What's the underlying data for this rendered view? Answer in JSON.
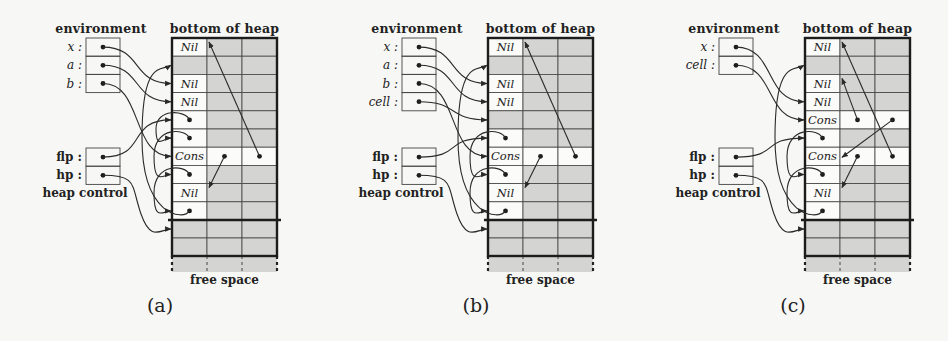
{
  "colors": {
    "background": "#f7f7f5",
    "allocated_cell": "#d4d4d2",
    "free_cell": "#fbfbf9",
    "line": "#2a2a2a"
  },
  "labels": {
    "environment": "environment",
    "bottom_of_heap": "bottom of heap",
    "heap_control": "heap control",
    "free_space": "free space",
    "flp": "flp :",
    "hp": "hp :"
  },
  "panels": [
    {
      "id": "a",
      "caption": "(a)",
      "offset_x": 0,
      "env_vars": [
        "x :",
        "a :",
        "b :"
      ],
      "rows": [
        {
          "label": "Nil",
          "white": [
            0
          ],
          "dots": []
        },
        {
          "label": "",
          "white": [],
          "dots": []
        },
        {
          "label": "Nil",
          "white": [
            0
          ],
          "dots": []
        },
        {
          "label": "Nil",
          "white": [
            0
          ],
          "dots": []
        },
        {
          "label": "",
          "white": [
            0
          ],
          "dots": [
            0
          ]
        },
        {
          "label": "",
          "white": [
            0
          ],
          "dots": [
            0
          ]
        },
        {
          "label": "Cons",
          "white": [
            0,
            1,
            2
          ],
          "dots": [
            1,
            2
          ]
        },
        {
          "label": "",
          "white": [
            0
          ],
          "dots": [
            0
          ]
        },
        {
          "label": "Nil",
          "white": [
            0
          ],
          "dots": []
        },
        {
          "label": "",
          "white": [
            0
          ],
          "dots": [
            0
          ]
        }
      ],
      "env_pointers": [
        {
          "from": "x",
          "to_row": 2
        },
        {
          "from": "a",
          "to_row": 3
        },
        {
          "from": "b",
          "to_row": 6
        }
      ],
      "flp_to_row": 4,
      "hp_to_row": 10,
      "free_list": [
        [
          4,
          5
        ],
        [
          5,
          7
        ],
        [
          7,
          9
        ],
        [
          9,
          1
        ]
      ],
      "heap_pointers": [
        {
          "from_row": 6,
          "from_col": 2,
          "to_row": 0
        },
        {
          "from_row": 6,
          "from_col": 1,
          "to_row": 8
        }
      ]
    },
    {
      "id": "b",
      "caption": "(b)",
      "offset_x": 316,
      "env_vars": [
        "x :",
        "a :",
        "b :",
        "cell :"
      ],
      "rows": [
        {
          "label": "Nil",
          "white": [
            0
          ],
          "dots": []
        },
        {
          "label": "",
          "white": [],
          "dots": []
        },
        {
          "label": "Nil",
          "white": [
            0
          ],
          "dots": []
        },
        {
          "label": "Nil",
          "white": [
            0
          ],
          "dots": []
        },
        {
          "label": "",
          "white": [],
          "dots": []
        },
        {
          "label": "",
          "white": [
            0
          ],
          "dots": [
            0
          ]
        },
        {
          "label": "Cons",
          "white": [
            0,
            1,
            2
          ],
          "dots": [
            1,
            2
          ]
        },
        {
          "label": "",
          "white": [
            0
          ],
          "dots": [
            0
          ]
        },
        {
          "label": "Nil",
          "white": [
            0
          ],
          "dots": []
        },
        {
          "label": "",
          "white": [
            0
          ],
          "dots": [
            0
          ]
        }
      ],
      "env_pointers": [
        {
          "from": "x",
          "to_row": 2
        },
        {
          "from": "a",
          "to_row": 3
        },
        {
          "from": "b",
          "to_row": 6
        },
        {
          "from": "cell",
          "to_row": 4
        }
      ],
      "flp_to_row": 5,
      "hp_to_row": 10,
      "free_list": [
        [
          5,
          7
        ],
        [
          7,
          9
        ],
        [
          9,
          1
        ]
      ],
      "heap_pointers": [
        {
          "from_row": 6,
          "from_col": 2,
          "to_row": 0
        },
        {
          "from_row": 6,
          "from_col": 1,
          "to_row": 8
        }
      ]
    },
    {
      "id": "c",
      "caption": "(c)",
      "offset_x": 633,
      "env_vars": [
        "x :",
        "cell :"
      ],
      "rows": [
        {
          "label": "Nil",
          "white": [
            0
          ],
          "dots": []
        },
        {
          "label": "",
          "white": [],
          "dots": []
        },
        {
          "label": "Nil",
          "white": [
            0
          ],
          "dots": []
        },
        {
          "label": "Nil",
          "white": [
            0
          ],
          "dots": []
        },
        {
          "label": "Cons",
          "white": [
            0,
            1,
            2
          ],
          "dots": [
            1,
            2
          ]
        },
        {
          "label": "",
          "white": [
            0
          ],
          "dots": [
            0
          ]
        },
        {
          "label": "Cons",
          "white": [
            0,
            1,
            2
          ],
          "dots": [
            1,
            2
          ]
        },
        {
          "label": "",
          "white": [
            0
          ],
          "dots": [
            0
          ]
        },
        {
          "label": "Nil",
          "white": [
            0
          ],
          "dots": []
        },
        {
          "label": "",
          "white": [
            0
          ],
          "dots": [
            0
          ]
        }
      ],
      "env_pointers": [
        {
          "from": "x",
          "to_row": 3
        },
        {
          "from": "cell",
          "to_row": 4
        }
      ],
      "flp_to_row": 5,
      "hp_to_row": 10,
      "free_list": [
        [
          5,
          7
        ],
        [
          7,
          9
        ],
        [
          9,
          1
        ]
      ],
      "heap_pointers": [
        {
          "from_row": 4,
          "from_col": 1,
          "to_row": 2
        },
        {
          "from_row": 4,
          "from_col": 2,
          "to_row": 6,
          "to_col_edge": true
        },
        {
          "from_row": 6,
          "from_col": 2,
          "to_row": 0
        },
        {
          "from_row": 6,
          "from_col": 1,
          "to_row": 8
        }
      ]
    }
  ]
}
